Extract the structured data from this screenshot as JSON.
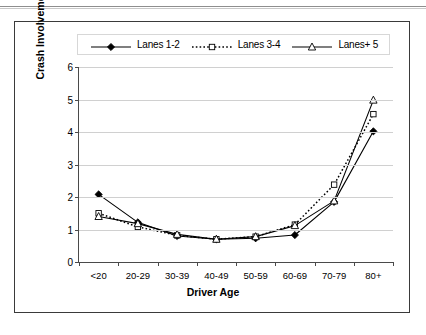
{
  "chart_data": {
    "type": "line",
    "title": "",
    "xlabel": "Driver Age",
    "ylabel": "Crash Involvement Ratio",
    "categories": [
      "<20",
      "20-29",
      "30-39",
      "40-49",
      "50-59",
      "60-69",
      "70-79",
      "80+"
    ],
    "ylim": [
      0,
      6
    ],
    "yticks": [
      0,
      1,
      2,
      3,
      4,
      5,
      6
    ],
    "grid": "horizontal",
    "legend_position": "top",
    "series": [
      {
        "name": "Lanes 1-2",
        "marker": "filled-diamond",
        "linestyle": "solid",
        "color": "#000000",
        "values": [
          2.08,
          1.22,
          0.8,
          0.7,
          0.73,
          0.83,
          1.85,
          4.02
        ]
      },
      {
        "name": "Lanes 3-4",
        "marker": "open-square",
        "linestyle": "dotted",
        "color": "#000000",
        "values": [
          1.5,
          1.08,
          0.82,
          0.7,
          0.78,
          1.15,
          2.38,
          4.55
        ]
      },
      {
        "name": "Lanes+ 5",
        "marker": "open-triangle",
        "linestyle": "solid",
        "color": "#000000",
        "values": [
          1.4,
          1.18,
          0.85,
          0.7,
          0.78,
          1.12,
          1.88,
          4.98
        ]
      }
    ]
  }
}
